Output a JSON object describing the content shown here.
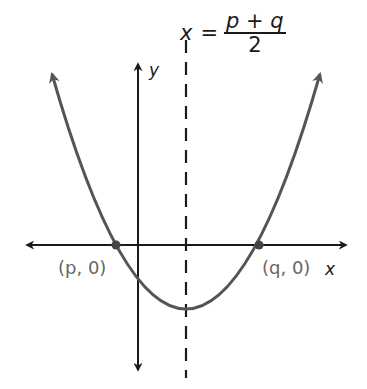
{
  "diagram": {
    "equation": {
      "lhs": "x",
      "equals": "=",
      "numerator": "p + q",
      "denominator": "2"
    },
    "axes": {
      "x_label": "x",
      "y_label": "y"
    },
    "points": [
      {
        "label": "(p, 0)"
      },
      {
        "label": "(q, 0)"
      }
    ],
    "colors": {
      "axis": "#1a1a1a",
      "curve": "#555555",
      "label_gray": "#666666"
    }
  }
}
